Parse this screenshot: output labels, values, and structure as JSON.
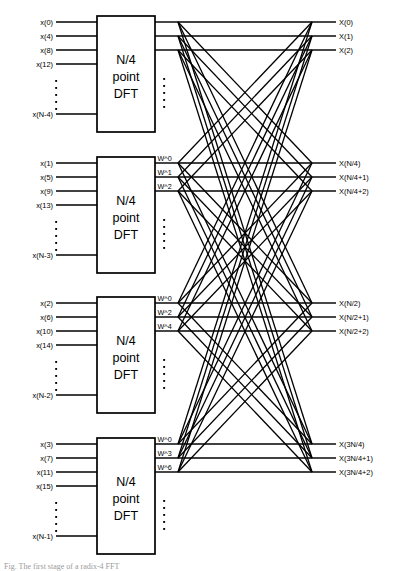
{
  "figure": {
    "block_label_line1": "N/4",
    "block_label_line2": "point",
    "block_label_line3": "DFT",
    "vertical_ellipsis": "⋮",
    "caption": "Fig. The first stage of a radix-4 FFT"
  },
  "colors": {
    "line": "#000000",
    "background": "#ffffff",
    "box_fill": "#ffffff",
    "box_stroke": "#000000",
    "caption": "#9a9a9a"
  },
  "blocks": [
    {
      "id": "dft-block-1",
      "inputs": [
        "x(0)",
        "x(4)",
        "x(8)",
        "x(12)",
        "x(N-4)"
      ],
      "twiddles": [],
      "outputs": [
        "X(0)",
        "X(1)",
        "X(2)"
      ]
    },
    {
      "id": "dft-block-2",
      "inputs": [
        "x(1)",
        "x(5)",
        "x(9)",
        "x(13)",
        "x(N-3)"
      ],
      "twiddles": [
        "W^0",
        "W^1",
        "W^2"
      ],
      "outputs": [
        "X(N/4)",
        "X(N/4+1)",
        "X(N/4+2)"
      ]
    },
    {
      "id": "dft-block-3",
      "inputs": [
        "x(2)",
        "x(6)",
        "x(10)",
        "x(14)",
        "x(N-2)"
      ],
      "twiddles": [
        "W^0",
        "W^2",
        "W^4"
      ],
      "outputs": [
        "X(N/2)",
        "X(N/2+1)",
        "X(N/2+2)"
      ]
    },
    {
      "id": "dft-block-4",
      "inputs": [
        "x(3)",
        "x(7)",
        "x(11)",
        "x(15)",
        "x(N-1)"
      ],
      "twiddles": [
        "W^0",
        "W^3",
        "W^6"
      ],
      "outputs": [
        "X(3N/4)",
        "X(3N/4+1)",
        "X(3N/4+2)"
      ]
    }
  ],
  "chart_data": {
    "type": "diagram",
    "node_count": 4,
    "inputs_per_block": 5,
    "outputs_per_block": 3,
    "total_inputs": 20,
    "total_outputs": 12,
    "input_sequence": [
      "x(0)",
      "x(4)",
      "x(8)",
      "x(12)",
      "x(N-4)",
      "x(1)",
      "x(5)",
      "x(9)",
      "x(13)",
      "x(N-3)",
      "x(2)",
      "x(6)",
      "x(10)",
      "x(14)",
      "x(N-2)",
      "x(3)",
      "x(7)",
      "x(11)",
      "x(15)",
      "x(N-1)"
    ],
    "output_sequence": [
      "X(0)",
      "X(1)",
      "X(2)",
      "X(N/4)",
      "X(N/4+1)",
      "X(N/4+2)",
      "X(N/2)",
      "X(N/2+1)",
      "X(N/2+2)",
      "X(3N/4)",
      "X(3N/4+1)",
      "X(3N/4+2)"
    ],
    "twiddle_factors": [
      [
        "W^0",
        "W^1",
        "W^2"
      ],
      [
        "W^0",
        "W^2",
        "W^4"
      ],
      [
        "W^0",
        "W^3",
        "W^6"
      ]
    ]
  }
}
